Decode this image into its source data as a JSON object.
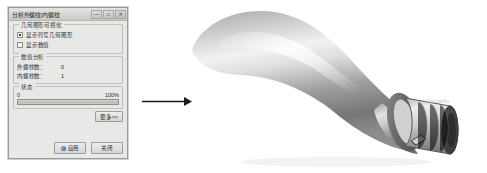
{
  "dialog": {
    "title": "分析外螺纹/内螺纹",
    "window_buttons": [
      {
        "name": "minimize",
        "glyph": "—"
      },
      {
        "name": "maximize",
        "glyph": "□"
      },
      {
        "name": "close",
        "glyph": "✕"
      }
    ],
    "groups": {
      "visualization": {
        "title": "几何图形可视化",
        "checkboxes": [
          {
            "label": "显示符号几何图形",
            "checked": true
          },
          {
            "label": "显示数值",
            "checked": false
          }
        ]
      },
      "analysis": {
        "title": "数值分析",
        "rows": [
          {
            "label": "外螺纹数：",
            "value": "0"
          },
          {
            "label": "内螺纹数：",
            "value": "1"
          }
        ]
      },
      "status": {
        "title": "状态",
        "min_label": "0",
        "max_label": "100%",
        "progress_percent": 100
      }
    },
    "buttons": {
      "more": "更多>>",
      "apply": "应用",
      "close": "关闭"
    }
  },
  "viewport": {
    "arrow_name": "right-arrow",
    "model_caption": "螺纹手柄零件三维模型",
    "watermark": "Chuanbo"
  },
  "colors": {
    "dialog_face": "#e8e8e6",
    "dialog_border": "#9a9a98",
    "model_gray": "#9b9b9b",
    "accent_blue": "#2f5f9e"
  }
}
